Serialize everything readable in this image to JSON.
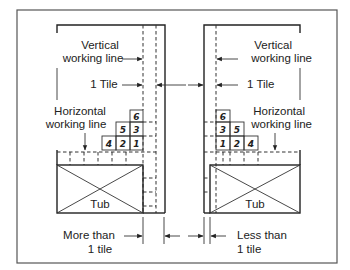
{
  "diagram": {
    "left_panel": {
      "vertical_label_line1": "Vertical",
      "vertical_label_line2": "working line",
      "tile_label": "1 Tile",
      "horizontal_label_line1": "Horizontal",
      "horizontal_label_line2": "working line",
      "tub_label": "Tub",
      "bottom_label_line1": "More than",
      "bottom_label_line2": "1 tile",
      "tiles": [
        {
          "row": 1,
          "labels": [
            "4",
            "2",
            "1"
          ]
        },
        {
          "row": 2,
          "labels": [
            "5",
            "3"
          ]
        },
        {
          "row": 3,
          "labels": [
            "6"
          ]
        }
      ]
    },
    "right_panel": {
      "vertical_label_line1": "Vertical",
      "vertical_label_line2": "working line",
      "tile_label": "1 Tile",
      "horizontal_label_line1": "Horizontal",
      "horizontal_label_line2": "working line",
      "tub_label": "Tub",
      "bottom_label_line1": "Less than",
      "bottom_label_line2": "1 tile",
      "tiles": [
        {
          "row": 1,
          "labels": [
            "1",
            "2",
            "4"
          ]
        },
        {
          "row": 2,
          "labels": [
            "3",
            "5"
          ]
        },
        {
          "row": 3,
          "labels": [
            "6"
          ]
        }
      ]
    }
  }
}
